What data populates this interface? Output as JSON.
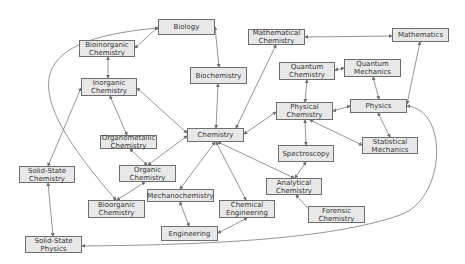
{
  "diagram": {
    "nodes": [
      {
        "id": "biology",
        "label": "Biology",
        "x": 158,
        "y": 19,
        "w": 57,
        "h": 16
      },
      {
        "id": "bioinorganic",
        "label": "Bioinorganic\nChemistry",
        "x": 79,
        "y": 40,
        "w": 56,
        "h": 17
      },
      {
        "id": "inorganic",
        "label": "Inorganic\nChemistry",
        "x": 81,
        "y": 78,
        "w": 56,
        "h": 18
      },
      {
        "id": "biochemistry",
        "label": "Biochemistry",
        "x": 190,
        "y": 67,
        "w": 57,
        "h": 17
      },
      {
        "id": "mathchem",
        "label": "Mathematical\nChemistry",
        "x": 248,
        "y": 29,
        "w": 57,
        "h": 16
      },
      {
        "id": "mathematics",
        "label": "Mathematics",
        "x": 392,
        "y": 28,
        "w": 57,
        "h": 14
      },
      {
        "id": "quantumchem",
        "label": "Quantum\nChemistry",
        "x": 279,
        "y": 62,
        "w": 56,
        "h": 18
      },
      {
        "id": "quantummech",
        "label": "Quantum\nMechanics",
        "x": 344,
        "y": 59,
        "w": 57,
        "h": 18
      },
      {
        "id": "physchem",
        "label": "Physical\nChemistry",
        "x": 276,
        "y": 102,
        "w": 57,
        "h": 18
      },
      {
        "id": "physics",
        "label": "Physics",
        "x": 350,
        "y": 99,
        "w": 57,
        "h": 14
      },
      {
        "id": "chemistry",
        "label": "Chemistry",
        "x": 187,
        "y": 128,
        "w": 57,
        "h": 14
      },
      {
        "id": "organometallic",
        "label": "Organometallic\nChemistry",
        "x": 100,
        "y": 135,
        "w": 57,
        "h": 14
      },
      {
        "id": "organic",
        "label": "Organic\nChemistry",
        "x": 119,
        "y": 165,
        "w": 57,
        "h": 17
      },
      {
        "id": "solidstatechem",
        "label": "Solid-State\nChemistry",
        "x": 19,
        "y": 166,
        "w": 56,
        "h": 17
      },
      {
        "id": "spectroscopy",
        "label": "Spectroscopy",
        "x": 278,
        "y": 145,
        "w": 56,
        "h": 17
      },
      {
        "id": "statmech",
        "label": "Statistical\nMechanics",
        "x": 362,
        "y": 137,
        "w": 56,
        "h": 17
      },
      {
        "id": "analytical",
        "label": "Analytical\nChemistry",
        "x": 266,
        "y": 178,
        "w": 56,
        "h": 17
      },
      {
        "id": "mechanochem",
        "label": "Mechanochemistry",
        "x": 147,
        "y": 189,
        "w": 67,
        "h": 13
      },
      {
        "id": "bioorganic",
        "label": "Bioorganic\nChemistry",
        "x": 88,
        "y": 200,
        "w": 57,
        "h": 18
      },
      {
        "id": "chemeng",
        "label": "Chemical\nEngineering",
        "x": 219,
        "y": 200,
        "w": 56,
        "h": 18
      },
      {
        "id": "forensic",
        "label": "Forensic\nChemistry",
        "x": 308,
        "y": 206,
        "w": 57,
        "h": 17
      },
      {
        "id": "engineering",
        "label": "Engineering",
        "x": 161,
        "y": 226,
        "w": 57,
        "h": 15
      },
      {
        "id": "solidstatephys",
        "label": "Solid-State\nPhysics",
        "x": 25,
        "y": 236,
        "w": 57,
        "h": 17
      }
    ],
    "edges": [
      {
        "from": "biology",
        "to": "bioinorganic",
        "d": "M158,27 L135,48",
        "both": true
      },
      {
        "from": "biology",
        "to": "biochemistry",
        "d": "M215,27 L219,67",
        "both": true
      },
      {
        "from": "biology",
        "to": "bioorganic",
        "d": "M158,28 C20,40 20,90 116,200",
        "both": true
      },
      {
        "from": "bioinorganic",
        "to": "inorganic",
        "d": "M108,57 L108,78",
        "both": true
      },
      {
        "from": "inorganic",
        "to": "organometallic",
        "d": "M110,96 L127,135",
        "both": true
      },
      {
        "from": "inorganic",
        "to": "chemistry",
        "d": "M137,88 L187,133",
        "both": true
      },
      {
        "from": "inorganic",
        "to": "solidstatechem",
        "d": "M81,88 L48,166",
        "both": true
      },
      {
        "from": "biochemistry",
        "to": "chemistry",
        "d": "M218,84 L216,128",
        "both": true
      },
      {
        "from": "mathchem",
        "to": "mathematics",
        "d": "M305,37 L392,36",
        "both": true
      },
      {
        "from": "mathchem",
        "to": "chemistry",
        "d": "M276,45 L236,128",
        "both": true
      },
      {
        "from": "quantumchem",
        "to": "quantummech",
        "d": "M335,70 L344,68",
        "both": true
      },
      {
        "from": "quantumchem",
        "to": "physchem",
        "d": "M307,80 L305,102",
        "both": true
      },
      {
        "from": "quantummech",
        "to": "physics",
        "d": "M373,77 L379,99",
        "both": true
      },
      {
        "from": "mathematics",
        "to": "physics",
        "d": "M420,42 L407,104",
        "both": true
      },
      {
        "from": "physchem",
        "to": "physics",
        "d": "M333,111 L350,106",
        "both": true
      },
      {
        "from": "physchem",
        "to": "chemistry",
        "d": "M276,112 L244,134",
        "both": true
      },
      {
        "from": "physchem",
        "to": "spectroscopy",
        "d": "M305,120 L306,145",
        "both": true
      },
      {
        "from": "physchem",
        "to": "statmech",
        "d": "M310,120 L362,145",
        "both": true
      },
      {
        "from": "physics",
        "to": "statmech",
        "d": "M378,113 L390,137",
        "both": true
      },
      {
        "from": "physics",
        "to": "solidstatephys",
        "d": "M407,106 C450,110 445,200 400,215 C330,240 200,245 82,246",
        "both": true
      },
      {
        "from": "chemistry",
        "to": "organic",
        "d": "M187,136 L148,165",
        "both": true
      },
      {
        "from": "chemistry",
        "to": "mechanochem",
        "d": "M215,142 L180,189",
        "both": true
      },
      {
        "from": "chemistry",
        "to": "chemeng",
        "d": "M216,142 L246,200",
        "both": true
      },
      {
        "from": "chemistry",
        "to": "analytical",
        "d": "M218,142 L294,178",
        "both": true
      },
      {
        "from": "spectroscopy",
        "to": "analytical",
        "d": "M306,162 L295,178",
        "both": true
      },
      {
        "from": "analytical",
        "to": "forensic",
        "d": "M296,195 L313,214",
        "both": true
      },
      {
        "from": "organometallic",
        "to": "organic",
        "d": "M130,149 L147,165",
        "both": true
      },
      {
        "from": "organic",
        "to": "bioorganic",
        "d": "M145,182 L117,200",
        "both": true
      },
      {
        "from": "solidstatechem",
        "to": "solidstatephys",
        "d": "M48,183 L53,236",
        "both": true
      },
      {
        "from": "mechanochem",
        "to": "engineering",
        "d": "M180,202 L189,226",
        "both": true
      },
      {
        "from": "chemeng",
        "to": "engineering",
        "d": "M247,218 L218,233",
        "both": true
      }
    ]
  },
  "style": {
    "node_fill": "#e8e8e8",
    "node_border": "#6e6e6e",
    "edge_color": "#7a7a7a",
    "text_color": "#333333"
  }
}
